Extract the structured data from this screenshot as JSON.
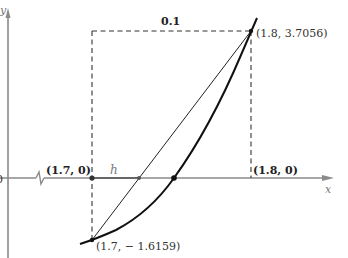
{
  "figure": {
    "axes": {
      "x_label": "x",
      "y_label": "y",
      "origin_label": "0",
      "axis_color": "#8a8a8a",
      "has_axis_break": true
    },
    "box": {
      "width_label": "0.1"
    },
    "points": {
      "left_axis": "(1.7, 0)",
      "right_axis": "(1.8, 0)",
      "upper_right": "(1.8, 3.7056)",
      "lower_left": "(1.7, − 1.6159)"
    },
    "step_label": "h",
    "curve_color": "#111111",
    "secant_color": "#222222",
    "dash_color": "#333333"
  }
}
